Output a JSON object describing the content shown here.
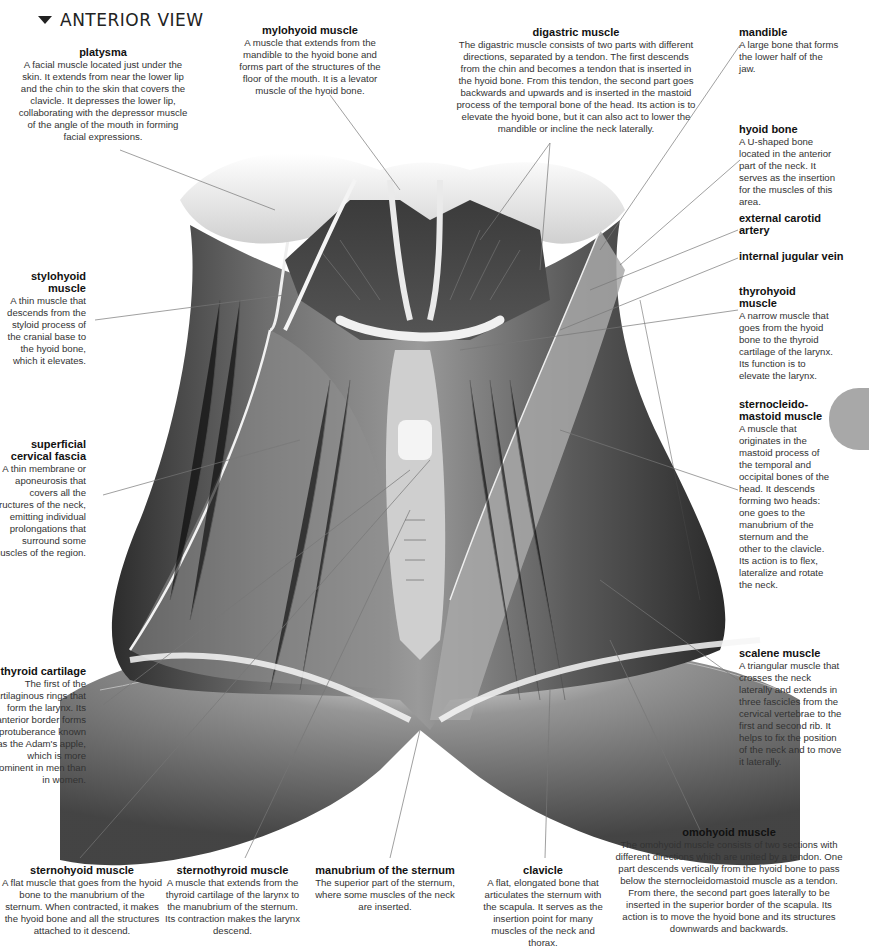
{
  "view_title": "ANTERIOR VIEW",
  "labels": {
    "platysma": {
      "title": "platysma",
      "text": "A facial muscle located just under the skin. It extends from near the lower lip and the chin to the skin that covers the clavicle. It depresses the lower lip, collaborating with the depressor muscle of the angle of the mouth in forming facial expressions."
    },
    "mylohyoid": {
      "title": "mylohyoid muscle",
      "text": "A muscle that extends from the mandible to the hyoid bone and forms part of the structures of the floor of the mouth. It is a levator muscle of the hyoid bone."
    },
    "digastric": {
      "title": "digastric muscle",
      "text": "The digastric muscle consists of two parts with different directions, separated by a tendon. The first descends from the chin and becomes a tendon that is inserted in the hyoid bone. From this tendon, the second part goes backwards and upwards and is inserted in the mastoid process of the temporal bone of the head. Its action is to elevate the hyoid bone, but it can also act to lower the mandible or incline the neck laterally."
    },
    "mandible": {
      "title": "mandible",
      "text": "A large bone that forms the lower half of the jaw."
    },
    "hyoid": {
      "title": "hyoid bone",
      "text": "A U-shaped bone located in the anterior part of the neck. It serves as the insertion for the muscles of this area."
    },
    "carotid": {
      "title": "external carotid artery",
      "text": ""
    },
    "jugular": {
      "title": "internal jugular vein",
      "text": ""
    },
    "thyrohyoid": {
      "title": "thyrohyoid muscle",
      "text": "A narrow muscle that goes from the hyoid bone to the thyroid cartilage of the larynx. Its function is to elevate the larynx."
    },
    "sternocleido": {
      "title": "sternocleido-mastoid muscle",
      "text": "A muscle that originates in the mastoid process of the temporal and occipital bones of the head. It descends forming two heads: one goes to the manubrium of the sternum and the other to the clavicle. Its action is to flex, lateralize and rotate the neck."
    },
    "scalene": {
      "title": "scalene muscle",
      "text": "A triangular muscle that crosses the neck laterally and extends in three fascicles from the cervical vertebrae to the first and second rib. It helps to fix the position of the neck and to move it laterally."
    },
    "stylohyoid": {
      "title": "stylohyoid muscle",
      "text": "A thin muscle that descends from the styloid process of the cranial base to the hyoid bone, which it elevates."
    },
    "fascia": {
      "title": "superficial cervical fascia",
      "text": "A thin membrane or aponeurosis that covers all the structures of the neck, emitting individual prolongations that surround some muscles of the region."
    },
    "thyroid": {
      "title": "thyroid cartilage",
      "text": "The first of the cartilaginous rings that form the larynx. Its anterior border forms a protuberance known as the Adam's apple, which is more prominent in men than in women."
    },
    "sternohyoid": {
      "title": "sternohyoid muscle",
      "text": "A flat muscle that goes from the hyoid bone to the manubrium of the sternum. When contracted, it makes the hyoid bone and all the structures attached to it descend."
    },
    "sternothyroid": {
      "title": "sternothyroid muscle",
      "text": "A muscle that extends from the thyroid cartilage of the larynx to the manubrium of the sternum. Its contraction makes the larynx descend."
    },
    "manubrium": {
      "title": "manubrium of the sternum",
      "text": "The superior part of the sternum, where some muscles of the neck are inserted."
    },
    "clavicle": {
      "title": "clavicle",
      "text": "A flat, elongated bone that articulates the sternum with the scapula. It serves as the insertion point for many muscles of the neck and thorax."
    },
    "omohyoid": {
      "title": "omohyoid muscle",
      "text": "The omohyoid muscle consists of two sections with different directions which are united by a tendon. One part descends vertically from the hyoid bone to pass below the sternocleidomastoid muscle as a tendon. From there, the second part goes laterally to be inserted in the superior border of the scapula. Its action is to move the hyoid bone and its structures downwards and backwards."
    }
  },
  "colors": {
    "muscle_dark": "#3a3a3a",
    "muscle_mid": "#6a6a6a",
    "tendon": "#e8e8e8",
    "leader": "#777777",
    "tab": "#a8a8a8"
  }
}
